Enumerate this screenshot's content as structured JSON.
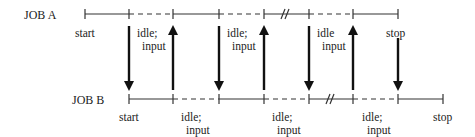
{
  "diagram": {
    "job_a": {
      "label": "JOB A",
      "start_label": "start",
      "stop_label": "stop",
      "segment_labels": [
        {
          "line1": "idle;",
          "line2": "input"
        },
        {
          "line1": "idle;",
          "line2": "input"
        },
        {
          "line1": "idle",
          "line2": "input"
        }
      ]
    },
    "job_b": {
      "label": "JOB B",
      "start_label": "start",
      "stop_label": "stop",
      "segment_labels": [
        {
          "line1": "idle;",
          "line2": "input"
        },
        {
          "line1": "idle;",
          "line2": "input"
        },
        {
          "line1": "idle;",
          "line2": "input"
        }
      ]
    },
    "arrows": [
      {
        "x": 129,
        "direction": "down"
      },
      {
        "x": 173,
        "direction": "up"
      },
      {
        "x": 219,
        "direction": "down"
      },
      {
        "x": 264,
        "direction": "up"
      },
      {
        "x": 309,
        "direction": "down"
      },
      {
        "x": 353,
        "direction": "up"
      },
      {
        "x": 398,
        "direction": "down"
      }
    ],
    "colors": {
      "ink": "#222222",
      "background": "#ffffff"
    }
  }
}
